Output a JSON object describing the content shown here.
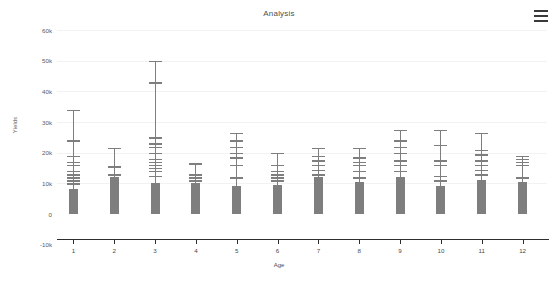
{
  "header": {
    "title": "Analysis",
    "menu_icon": "hamburger-menu-icon"
  },
  "colors": {
    "bar": "#7e7e7e",
    "gridline": "#f2f2f2",
    "axis": "#2e2e2e",
    "text": "#4a4a4a",
    "background": "#ffffff"
  },
  "chart_data": {
    "type": "bar",
    "title": "Analysis",
    "xlabel": "Age",
    "ylabel": "Yields",
    "categories": [
      "1",
      "2",
      "3",
      "4",
      "5",
      "6",
      "7",
      "8",
      "9",
      "10",
      "11",
      "12"
    ],
    "values": [
      8000,
      12000,
      10000,
      10000,
      9000,
      9500,
      12000,
      10500,
      12000,
      9000,
      11000,
      10500
    ],
    "ylim": [
      -10000,
      60000
    ],
    "ytick_values": [
      60000,
      50000,
      40000,
      30000,
      20000,
      10000,
      0,
      -10000
    ],
    "ytick_labels": [
      "60k",
      "50k",
      "40k",
      "30k",
      "20k",
      "10k",
      "0",
      "-10k"
    ],
    "grid": true,
    "legend": "none",
    "error_bar_style": "stacked-whisker-caps",
    "series": [
      {
        "name": "Yields",
        "values": [
          8000,
          12000,
          10000,
          10000,
          9000,
          9500,
          12000,
          10500,
          12000,
          9000,
          11000,
          10500
        ]
      }
    ],
    "error_bars": [
      {
        "category": "1",
        "bar": 8000,
        "max": 34000,
        "caps": [
          10000,
          11000,
          12000,
          13000,
          14000,
          16000,
          17000,
          19000,
          24000,
          34000
        ]
      },
      {
        "category": "2",
        "bar": 12000,
        "max": 21500,
        "caps": [
          13000,
          15500,
          21500
        ]
      },
      {
        "category": "3",
        "bar": 10000,
        "max": 50000,
        "caps": [
          12500,
          14000,
          15000,
          16000,
          17000,
          18000,
          20000,
          22000,
          23000,
          25000,
          43000,
          50000
        ]
      },
      {
        "category": "4",
        "bar": 10000,
        "max": 16500,
        "caps": [
          11000,
          12000,
          13000,
          16500
        ]
      },
      {
        "category": "5",
        "bar": 9000,
        "max": 26500,
        "caps": [
          12000,
          16000,
          18500,
          20000,
          22000,
          24000,
          26500
        ]
      },
      {
        "category": "6",
        "bar": 9500,
        "max": 20000,
        "caps": [
          11000,
          12000,
          13000,
          14000,
          16000,
          20000
        ]
      },
      {
        "category": "7",
        "bar": 12000,
        "max": 21500,
        "caps": [
          13000,
          14500,
          16000,
          17500,
          19000,
          21500
        ]
      },
      {
        "category": "8",
        "bar": 10500,
        "max": 21500,
        "caps": [
          12000,
          14000,
          16000,
          17000,
          18500,
          21500
        ]
      },
      {
        "category": "9",
        "bar": 12000,
        "max": 27500,
        "caps": [
          14000,
          16000,
          17500,
          20000,
          22000,
          24000,
          27500
        ]
      },
      {
        "category": "10",
        "bar": 9000,
        "max": 27500,
        "caps": [
          11000,
          12500,
          16000,
          17500,
          22500,
          27500
        ]
      },
      {
        "category": "11",
        "bar": 11000,
        "max": 26500,
        "caps": [
          13000,
          14500,
          16000,
          17500,
          19500,
          21000,
          26500
        ]
      },
      {
        "category": "12",
        "bar": 10500,
        "max": 19000,
        "caps": [
          12000,
          16000,
          17000,
          18000,
          19000
        ]
      }
    ]
  }
}
